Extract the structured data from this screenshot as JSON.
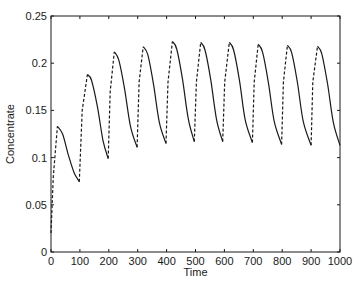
{
  "chart_data": {
    "type": "line",
    "title": "",
    "xlabel": "Time",
    "ylabel": "Concentrate",
    "xlim": [
      0,
      1000
    ],
    "ylim": [
      0,
      0.25
    ],
    "xticks": [
      0,
      100,
      200,
      300,
      400,
      500,
      600,
      700,
      800,
      900,
      1000
    ],
    "xtick_labels": [
      "0",
      "100",
      "200",
      "300",
      "400",
      "500",
      "600",
      "700",
      "800",
      "900",
      "1000"
    ],
    "yticks": [
      0,
      0.05,
      0.1,
      0.15,
      0.2,
      0.25
    ],
    "ytick_labels": [
      "0",
      "0.05",
      "0.1",
      "0.15",
      "0.2",
      "0.25"
    ],
    "grid": false,
    "legend": null,
    "line_color": "#1a1a1a",
    "series": [
      {
        "name": "Concentrate",
        "description": "Periodically forced oscillation: solid decaying segments between peaks and troughs, dashed vertical jumps every ~100 time units",
        "segments": [
          {
            "style": "dashed",
            "points": [
              [
                0,
                0.02
              ],
              [
                8,
                0.08
              ],
              [
                22,
                0.133
              ]
            ]
          },
          {
            "style": "solid",
            "points": [
              [
                22,
                0.133
              ],
              [
                40,
                0.125
              ],
              [
                60,
                0.103
              ],
              [
                80,
                0.084
              ],
              [
                98,
                0.0745
              ]
            ]
          },
          {
            "style": "dashed",
            "points": [
              [
                98,
                0.0745
              ],
              [
                108,
                0.15
              ],
              [
                126,
                0.188
              ]
            ]
          },
          {
            "style": "solid",
            "points": [
              [
                126,
                0.188
              ],
              [
                140,
                0.182
              ],
              [
                160,
                0.155
              ],
              [
                180,
                0.118
              ],
              [
                198,
                0.099
              ]
            ]
          },
          {
            "style": "dashed",
            "points": [
              [
                198,
                0.099
              ],
              [
                205,
                0.17
              ],
              [
                219,
                0.212
              ]
            ]
          },
          {
            "style": "solid",
            "points": [
              [
                219,
                0.212
              ],
              [
                235,
                0.203
              ],
              [
                255,
                0.172
              ],
              [
                275,
                0.133
              ],
              [
                298,
                0.111
              ]
            ]
          },
          {
            "style": "dashed",
            "points": [
              [
                298,
                0.111
              ],
              [
                305,
                0.18
              ],
              [
                319,
                0.2175
              ]
            ]
          },
          {
            "style": "solid",
            "points": [
              [
                319,
                0.2175
              ],
              [
                335,
                0.209
              ],
              [
                355,
                0.177
              ],
              [
                375,
                0.137
              ],
              [
                398,
                0.115
              ]
            ]
          },
          {
            "style": "dashed",
            "points": [
              [
                398,
                0.115
              ],
              [
                405,
                0.18
              ],
              [
                420,
                0.223
              ]
            ]
          },
          {
            "style": "solid",
            "points": [
              [
                420,
                0.223
              ],
              [
                435,
                0.215
              ],
              [
                455,
                0.183
              ],
              [
                475,
                0.141
              ],
              [
                496,
                0.117
              ]
            ]
          },
          {
            "style": "dashed",
            "points": [
              [
                496,
                0.117
              ],
              [
                503,
                0.18
              ],
              [
                518,
                0.222
              ]
            ]
          },
          {
            "style": "solid",
            "points": [
              [
                518,
                0.222
              ],
              [
                533,
                0.214
              ],
              [
                553,
                0.182
              ],
              [
                573,
                0.14
              ],
              [
                594,
                0.117
              ]
            ]
          },
          {
            "style": "dashed",
            "points": [
              [
                594,
                0.117
              ],
              [
                601,
                0.18
              ],
              [
                617,
                0.222
              ]
            ]
          },
          {
            "style": "solid",
            "points": [
              [
                617,
                0.222
              ],
              [
                632,
                0.214
              ],
              [
                652,
                0.182
              ],
              [
                672,
                0.14
              ],
              [
                697,
                0.116
              ]
            ]
          },
          {
            "style": "dashed",
            "points": [
              [
                697,
                0.116
              ],
              [
                703,
                0.18
              ],
              [
                717,
                0.22
              ]
            ]
          },
          {
            "style": "solid",
            "points": [
              [
                717,
                0.22
              ],
              [
                732,
                0.212
              ],
              [
                752,
                0.18
              ],
              [
                772,
                0.139
              ],
              [
                798,
                0.114
              ]
            ]
          },
          {
            "style": "dashed",
            "points": [
              [
                798,
                0.114
              ],
              [
                804,
                0.18
              ],
              [
                818,
                0.219
              ]
            ]
          },
          {
            "style": "solid",
            "points": [
              [
                818,
                0.219
              ],
              [
                833,
                0.211
              ],
              [
                853,
                0.179
              ],
              [
                873,
                0.138
              ],
              [
                900,
                0.113
              ]
            ]
          },
          {
            "style": "dashed",
            "points": [
              [
                900,
                0.113
              ],
              [
                906,
                0.18
              ],
              [
                922,
                0.218
              ]
            ]
          },
          {
            "style": "solid",
            "points": [
              [
                922,
                0.218
              ],
              [
                937,
                0.21
              ],
              [
                957,
                0.178
              ],
              [
                977,
                0.137
              ],
              [
                1000,
                0.113
              ]
            ]
          }
        ],
        "peaks": [
          [
            22,
            0.133
          ],
          [
            126,
            0.188
          ],
          [
            219,
            0.212
          ],
          [
            319,
            0.2175
          ],
          [
            420,
            0.223
          ],
          [
            518,
            0.222
          ],
          [
            617,
            0.222
          ],
          [
            717,
            0.22
          ],
          [
            818,
            0.219
          ],
          [
            922,
            0.218
          ]
        ],
        "troughs": [
          [
            98,
            0.0745
          ],
          [
            198,
            0.099
          ],
          [
            298,
            0.111
          ],
          [
            398,
            0.115
          ],
          [
            496,
            0.117
          ],
          [
            594,
            0.117
          ],
          [
            697,
            0.116
          ],
          [
            798,
            0.114
          ],
          [
            900,
            0.113
          ],
          [
            1000,
            0.113
          ]
        ]
      }
    ]
  }
}
